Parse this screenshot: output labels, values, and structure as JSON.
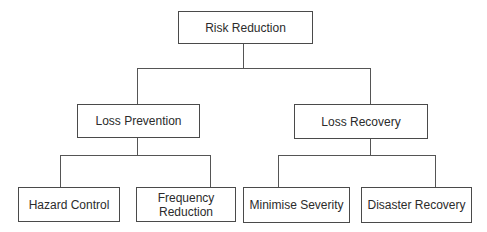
{
  "diagram": {
    "type": "hierarchy-tree",
    "root": {
      "label": "Risk Reduction",
      "children": [
        {
          "label": "Loss Prevention",
          "children": [
            {
              "label": "Hazard Control"
            },
            {
              "label": "Frequency Reduction",
              "lines": [
                "Frequency",
                "Reduction"
              ]
            }
          ]
        },
        {
          "label": "Loss Recovery",
          "children": [
            {
              "label": "Minimise Severity"
            },
            {
              "label": "Disaster Recovery"
            }
          ]
        }
      ]
    }
  },
  "colors": {
    "line": "#555555",
    "border": "#4a4a4a",
    "text": "#2b2b2b",
    "background": "#ffffff"
  }
}
